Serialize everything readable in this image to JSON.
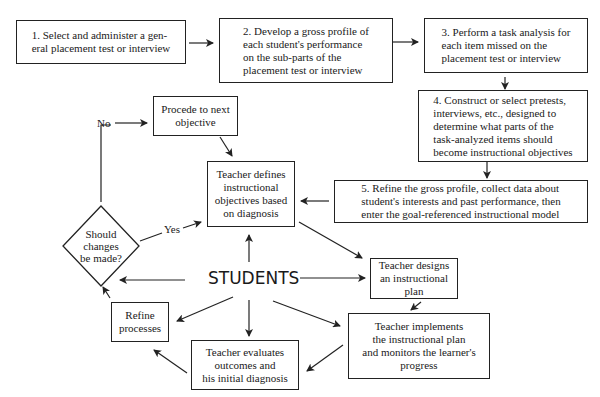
{
  "diagram": {
    "steps": [
      {
        "id": "step1",
        "text": "1. Select and administer a gen-\n    eral placement test or interview"
      },
      {
        "id": "step2",
        "text": "2. Develop a gross profile of\n    each student's performance\n    on the sub-parts of the\n    placement test or interview"
      },
      {
        "id": "step3",
        "text": "3. Perform a task analysis for\n    each item missed on the\n    placement test or interview"
      },
      {
        "id": "step4",
        "text": "4. Construct or select pretests,\n    interviews, etc., designed to\n    determine what parts of the\n    task-analyzed items should\n    become instructional objectives"
      },
      {
        "id": "step5",
        "text": "5. Refine the gross profile, collect data about\n    student's interests and past performance, then\n    enter the goal-referenced instructional model"
      }
    ],
    "cycle": {
      "center": "STUDENTS",
      "proceed": "Procede to next\nobjective",
      "defines": "Teacher defines\ninstructional\nobjectives based\non diagnosis",
      "designs": "Teacher designs\nan instructional\nplan",
      "implements": "Teacher implements\nthe instructional plan\nand monitors the learner's\nprogress",
      "evaluates": "Teacher evaluates\noutcomes and\nhis initial diagnosis",
      "refine": "Refine\nprocesses",
      "decision": "Should\nchanges\nbe made?",
      "yes_label": "Yes",
      "no_label": "No"
    }
  }
}
